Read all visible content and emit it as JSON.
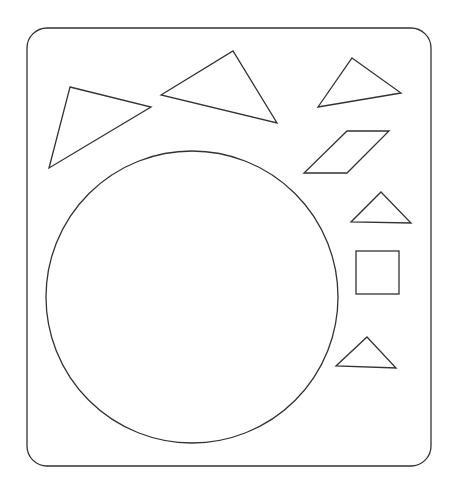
{
  "canvas": {
    "width": 457,
    "height": 490,
    "background": "#ffffff"
  },
  "stroke_color": "#333333",
  "board": {
    "x": 27,
    "y": 28,
    "width": 404,
    "height": 438,
    "radius": 20
  },
  "shapes": {
    "triangle_large_left": {
      "points": "70,87 151,107 49,168"
    },
    "triangle_large_top": {
      "points": "161,95 233,51 277,123"
    },
    "triangle_top_right": {
      "points": "352,58 401,93 318,107"
    },
    "parallelogram": {
      "points": "347,131 389,131 347,173 304,173"
    },
    "triangle_small_mid": {
      "points": "381,192 411,223 351,222"
    },
    "square": {
      "x": 356,
      "y": 251,
      "width": 43,
      "height": 43
    },
    "triangle_small_bottom": {
      "points": "367,337 396,368 336,366"
    },
    "circle": {
      "cx": 192,
      "cy": 297,
      "r": 146
    }
  }
}
